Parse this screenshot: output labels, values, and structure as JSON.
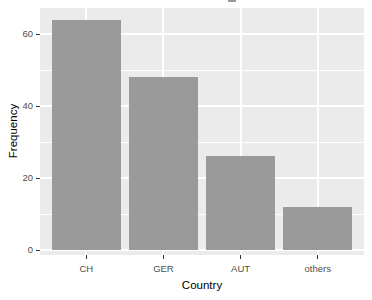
{
  "chart_data": {
    "type": "bar",
    "categories": [
      "CH",
      "GER",
      "AUT",
      "others"
    ],
    "values": [
      64,
      48,
      26,
      12
    ],
    "title": "",
    "xlabel": "Country",
    "ylabel": "Frequency",
    "ylim": [
      0,
      67
    ],
    "yticks_major": [
      0,
      20,
      40,
      60
    ],
    "yticks_minor": [
      10,
      30,
      50
    ],
    "grid": "major and minor horizontal white gridlines, vertical white gridlines at category centers",
    "legend": false,
    "style": "ggplot2-gray-theme",
    "colors": {
      "bar_fill": "#9A9A9A",
      "panel_bg": "#EBEBEB",
      "grid_major": "#FFFFFF",
      "grid_minor": "#FFFFFF",
      "axis_text": "#4D4D4D",
      "tick_mark": "#333333",
      "outer_bg": "#FFFFFF"
    }
  }
}
